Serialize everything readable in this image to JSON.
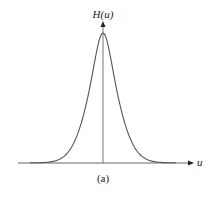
{
  "figure": {
    "y_axis_label": "H(u)",
    "x_axis_label": "u",
    "caption": "(a)",
    "line_color": "#555555",
    "axis_color": "#666666"
  },
  "chart_data": {
    "type": "line",
    "title": "",
    "xlabel": "u",
    "ylabel": "H(u)",
    "x": [
      -3,
      -2.5,
      -2,
      -1.5,
      -1,
      -0.5,
      0,
      0.5,
      1,
      1.5,
      2,
      2.5,
      3
    ],
    "series": [
      {
        "name": "H(u)",
        "values": [
          0.01,
          0.03,
          0.08,
          0.2,
          0.45,
          0.8,
          1.0,
          0.8,
          0.45,
          0.2,
          0.08,
          0.03,
          0.01
        ]
      }
    ],
    "xlim": [
      -5,
      5
    ],
    "ylim": [
      0,
      1.1
    ],
    "grid": false,
    "legend": "none"
  }
}
